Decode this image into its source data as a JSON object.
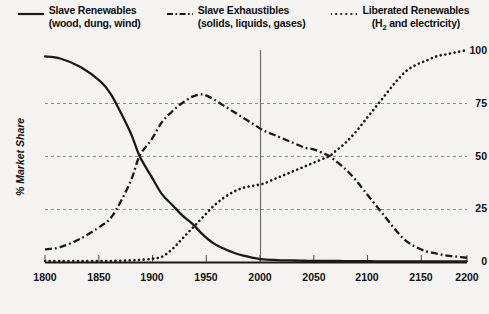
{
  "chart_data": {
    "type": "line",
    "title": "",
    "xlabel": "",
    "ylabel": "% Market Share",
    "xlim": [
      1785,
      2200
    ],
    "ylim": [
      0,
      100
    ],
    "grid": true,
    "gridlines_y": [
      25,
      50,
      75
    ],
    "legend_position": "top",
    "xticks": [
      "1800",
      "1850",
      "1900",
      "1950",
      "2000",
      "2050",
      "2100",
      "2150",
      "2200"
    ],
    "xtick_values": [
      1800,
      1850,
      1900,
      1950,
      2000,
      2050,
      2100,
      2150,
      2200
    ],
    "yticks": [
      "0",
      "25",
      "50",
      "75",
      "100"
    ],
    "ytick_values": [
      0,
      25,
      50,
      75,
      100
    ],
    "annotations": [
      {
        "type": "vertical-line",
        "x": 2000,
        "label": ""
      }
    ],
    "x": [
      1785,
      1800,
      1820,
      1840,
      1850,
      1860,
      1870,
      1878,
      1890,
      1900,
      1910,
      1920,
      1930,
      1940,
      1950,
      1960,
      1970,
      1980,
      1990,
      2000,
      2010,
      2020,
      2030,
      2040,
      2050,
      2060,
      2065,
      2070,
      2080,
      2090,
      2100,
      2110,
      2120,
      2130,
      2140,
      2150,
      2160,
      2170,
      2180,
      2190,
      2200
    ],
    "series": [
      {
        "name": "Slave Renewables",
        "sublabel": "(wood, dung, wind)",
        "style": "solid",
        "color": "#1a1a1a",
        "values": [
          97,
          96,
          92,
          85,
          79,
          70,
          60,
          50,
          40,
          32,
          27,
          22,
          18,
          13,
          9,
          6.5,
          4.5,
          3,
          2,
          1.2,
          1,
          0.8,
          0.7,
          0.6,
          0.5,
          0.5,
          0.5,
          0.5,
          0.4,
          0.4,
          0.4,
          0.3,
          0.3,
          0.3,
          0.3,
          0.3,
          0.3,
          0.3,
          0.3,
          0.3,
          0.3
        ]
      },
      {
        "name": "Slave Exhaustibles",
        "sublabel": "(solids, liquids, gases)",
        "style": "dashdot",
        "color": "#1a1a1a",
        "values": [
          6,
          7,
          11,
          17,
          21,
          29,
          39,
          50,
          58,
          66,
          71,
          75,
          78,
          79,
          77,
          74,
          71,
          68,
          65,
          62,
          60,
          58,
          56,
          54,
          53,
          51,
          50,
          48,
          44,
          39,
          33,
          27,
          21,
          15,
          10,
          7,
          5,
          4,
          3,
          2.5,
          2
        ]
      },
      {
        "name": "Liberated Renewables",
        "sublabel": "(H₂ and electricity)",
        "style": "dotted",
        "color": "#1a1a1a",
        "values": [
          0.5,
          0.5,
          0.5,
          0.5,
          0.5,
          0.6,
          0.8,
          1,
          1.5,
          2.5,
          6,
          11,
          16,
          21,
          26,
          30,
          33,
          35,
          36,
          37,
          39,
          41,
          43,
          45,
          47,
          49,
          50,
          52,
          56,
          61,
          67,
          73,
          79,
          85,
          90,
          93,
          95,
          97,
          98,
          99,
          100
        ]
      }
    ]
  },
  "legend": {
    "items": [
      {
        "label": "Slave Renewables",
        "sublabel": "(wood, dung, wind)",
        "swatch": "solid-line-swatch"
      },
      {
        "label": "Slave Exhaustibles",
        "sublabel": "(solids, liquids, gases)",
        "swatch": "dashdot-line-swatch"
      },
      {
        "label": "Liberated Renewables",
        "sublabel": "",
        "swatch": "dotted-line-swatch"
      }
    ],
    "liberated_sub_pre": "(H",
    "liberated_sub_subscript": "2",
    "liberated_sub_post": " and electricity)"
  },
  "axes": {
    "y_label": "% Market Share",
    "y_ticks": [
      "100",
      "75",
      "50",
      "25",
      "0"
    ],
    "x_ticks": [
      "1800",
      "1850",
      "1900",
      "1950",
      "2000",
      "2050",
      "2100",
      "2150",
      "2200"
    ]
  },
  "colors": {
    "background": "#f4f3f1",
    "ink": "#1a1a1a",
    "grid": "#8d8d8d",
    "marker_line": "#6e6e6e"
  }
}
